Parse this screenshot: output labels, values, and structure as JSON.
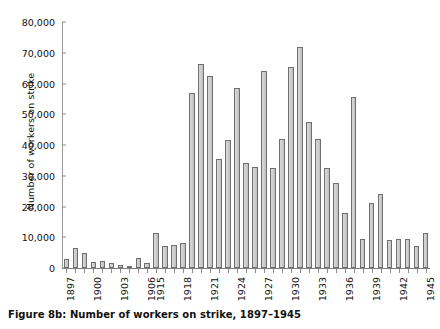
{
  "figure": {
    "caption": "Figure 8b: Number of workers on strike, 1897–1945",
    "ylabel": "Number of workers on strike"
  },
  "chart_data": {
    "type": "bar",
    "title": "Figure 8b: Number of workers on strike, 1897–1945",
    "xlabel": "",
    "ylabel": "Number of workers on strike",
    "ylim": [
      0,
      80000
    ],
    "ytick_labels": [
      "0",
      "10,000",
      "20,000",
      "30,000",
      "40,000",
      "50,000",
      "60,000",
      "70,000",
      "80,000"
    ],
    "ytick_values": [
      0,
      10000,
      20000,
      30000,
      40000,
      50000,
      60000,
      70000,
      80000
    ],
    "grid": false,
    "legend": null,
    "bar_color": "#cccccc",
    "bar_edge_color": "#6f6f6f",
    "labeled_xticks": [
      "1897",
      "1900",
      "1903",
      "1906",
      "1915",
      "1918",
      "1921",
      "1924",
      "1927",
      "1930",
      "1933",
      "1936",
      "1939",
      "1942",
      "1945"
    ],
    "categories": [
      "1897",
      "1898",
      "1899",
      "1900",
      "1901",
      "1902",
      "1903",
      "1904",
      "1905",
      "1906",
      "1915",
      "1916",
      "1917",
      "1918",
      "1919",
      "1920",
      "1921",
      "1922",
      "1923",
      "1924",
      "1925",
      "1926",
      "1927",
      "1928",
      "1929",
      "1930",
      "1931",
      "1932",
      "1933",
      "1934",
      "1935",
      "1936",
      "1937",
      "1938",
      "1939",
      "1940",
      "1941",
      "1942",
      "1943",
      "1944",
      "1945"
    ],
    "values": [
      3000,
      6500,
      5000,
      1800,
      2200,
      1700,
      1100,
      800,
      3400,
      1700,
      11500,
      7200,
      7500,
      8000,
      57000,
      66500,
      62500,
      35500,
      41500,
      58500,
      34000,
      33000,
      64000,
      32500,
      42000,
      65500,
      72000,
      47500,
      42000,
      32500,
      27500,
      18000,
      55500,
      9500,
      21000,
      24000,
      9000,
      9500,
      9500,
      7000,
      11500
    ]
  }
}
